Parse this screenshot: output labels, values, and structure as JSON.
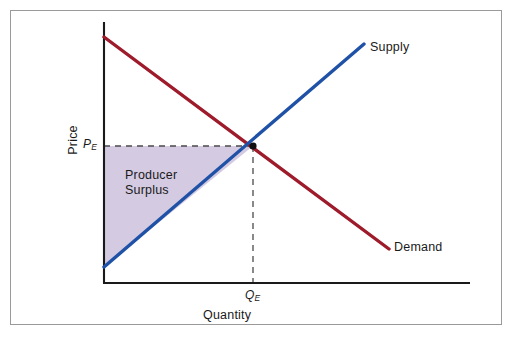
{
  "figure": {
    "border_color": "#9a9a9a",
    "background": "#ffffff"
  },
  "axes": {
    "x_label": "Quantity",
    "y_label": "Price",
    "axis_color": "#1a1a1a",
    "origin": {
      "x": 104,
      "y": 283
    },
    "x_axis_end": {
      "x": 470,
      "y": 283
    },
    "y_axis_top": {
      "x": 104,
      "y": 22
    }
  },
  "markers": {
    "price_equilibrium_symbol": "P",
    "price_equilibrium_subscript": "E",
    "quantity_equilibrium_symbol": "Q",
    "quantity_equilibrium_subscript": "E",
    "equilibrium_dot_color": "#111111"
  },
  "curves": {
    "supply": {
      "label": "Supply",
      "color": "#1f52a6",
      "width": 3.4,
      "start": {
        "x": 104,
        "y": 267
      },
      "end": {
        "x": 364,
        "y": 44
      }
    },
    "demand": {
      "label": "Demand",
      "color": "#9e1b2b",
      "width": 3.4,
      "start": {
        "x": 104,
        "y": 37
      },
      "end": {
        "x": 389,
        "y": 249
      }
    }
  },
  "region": {
    "name": "Producer Surplus",
    "label_line1": "Producer",
    "label_line2": "Surplus",
    "fill_color": "#ccc1dd",
    "fill_opacity": 0.85,
    "vertices": [
      {
        "x": 104,
        "y": 146
      },
      {
        "x": 253,
        "y": 146
      },
      {
        "x": 104,
        "y": 267
      }
    ]
  },
  "guides": {
    "dash_color": "#4a4a4a",
    "dash_pattern": "6 5",
    "horizontal_price_line": {
      "x1": 104,
      "y1": 146,
      "x2": 253,
      "y2": 146
    },
    "vertical_quantity_line": {
      "x1": 253,
      "y1": 146,
      "x2": 253,
      "y2": 283
    }
  },
  "chart_data": {
    "type": "line",
    "xlabel": "Quantity",
    "ylabel": "Price",
    "grid": false,
    "legend": "inline-curve-labels",
    "xlim": [
      0,
      100
    ],
    "ylim": [
      0,
      100
    ],
    "tick_labels": {
      "x": [
        "Q_E"
      ],
      "y": [
        "P_E"
      ]
    },
    "series": [
      {
        "name": "Supply",
        "color": "#1f52a6",
        "x": [
          0,
          100
        ],
        "values": [
          6,
          92
        ]
      },
      {
        "name": "Demand",
        "color": "#9e1b2b",
        "x": [
          0,
          110
        ],
        "values": [
          94,
          13
        ]
      }
    ],
    "equilibrium": {
      "label": "Equilibrium",
      "x": 57,
      "y": 53,
      "x_tick_label": "Q_E",
      "y_tick_label": "P_E"
    },
    "shaded_regions": [
      {
        "name": "Producer Surplus",
        "color": "#ccc1dd",
        "bounded_by": [
          "Price axis",
          "P_E horizontal line",
          "Supply curve"
        ],
        "vertices_data": [
          [
            0,
            53
          ],
          [
            57,
            53
          ],
          [
            0,
            6
          ]
        ]
      }
    ],
    "annotations": [
      {
        "text": "Supply",
        "x": 100,
        "y": 92
      },
      {
        "text": "Demand",
        "x": 110,
        "y": 13
      },
      {
        "text": "Producer Surplus",
        "x": 18,
        "y": 38
      }
    ]
  }
}
